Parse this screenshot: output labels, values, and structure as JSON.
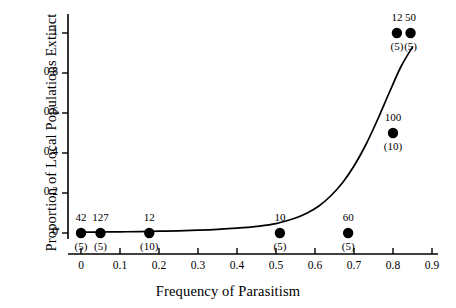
{
  "chart_data": {
    "type": "scatter",
    "title": "",
    "xlabel": "Frequency of Parasitism",
    "ylabel": "Proportion of Local Populations Extinct",
    "xlim": [
      0,
      0.9
    ],
    "ylim": [
      0,
      1.05
    ],
    "grid": false,
    "legend": "none",
    "xticks": [
      "0",
      "0.1",
      "0.2",
      "0.3",
      "0.4",
      "0.5",
      "0.6",
      "0.7",
      "0.8",
      "0.9"
    ],
    "xtick_values": [
      0,
      0.1,
      0.2,
      0.3,
      0.4,
      0.5,
      0.6,
      0.7,
      0.8,
      0.9
    ],
    "yticks": [
      "0",
      "0.2",
      "0.4",
      "0.6",
      "0.8",
      "1"
    ],
    "ytick_values": [
      0,
      0.2,
      0.4,
      0.6,
      0.8,
      1
    ],
    "marker_color": "#000000",
    "curve_color": "#000000",
    "points": [
      {
        "x": 0.0,
        "y": 0.0,
        "label_above": "42",
        "label_below": "(5)"
      },
      {
        "x": 0.05,
        "y": 0.0,
        "label_above": "127",
        "label_below": "(5)"
      },
      {
        "x": 0.175,
        "y": 0.0,
        "label_above": "12",
        "label_below": "(10)"
      },
      {
        "x": 0.51,
        "y": 0.0,
        "label_above": "10",
        "label_below": "(5)"
      },
      {
        "x": 0.685,
        "y": 0.0,
        "label_above": "60",
        "label_below": "(5)"
      },
      {
        "x": 0.8,
        "y": 0.5,
        "label_above": "100",
        "label_below": "(10)"
      },
      {
        "x": 0.81,
        "y": 1.0,
        "label_above": "12",
        "label_below": "(5)"
      },
      {
        "x": 0.845,
        "y": 1.0,
        "label_above": "50",
        "label_below": "(5)"
      }
    ],
    "fitted_curve": {
      "name": "logistic fit",
      "x": [
        0.0,
        0.05,
        0.1,
        0.15,
        0.2,
        0.25,
        0.3,
        0.35,
        0.4,
        0.45,
        0.5,
        0.55,
        0.58,
        0.61,
        0.64,
        0.67,
        0.7,
        0.73,
        0.76,
        0.79,
        0.82,
        0.85
      ],
      "y": [
        0.004,
        0.005,
        0.006,
        0.007,
        0.009,
        0.011,
        0.014,
        0.018,
        0.024,
        0.033,
        0.047,
        0.075,
        0.1,
        0.135,
        0.185,
        0.25,
        0.335,
        0.44,
        0.565,
        0.7,
        0.83,
        0.93
      ]
    }
  }
}
